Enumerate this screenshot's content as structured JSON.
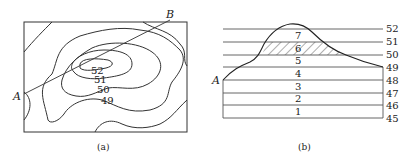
{
  "figure_a": {
    "caption": "(a)",
    "point_a": "A",
    "point_b": "B",
    "contour_labels": [
      "52",
      "51",
      "50",
      "49"
    ]
  },
  "figure_b": {
    "caption": "(b)",
    "point_a": "A",
    "elevation_labels": [
      "52",
      "51",
      "50",
      "49",
      "48",
      "47",
      "46",
      "45"
    ],
    "band_labels": [
      "7",
      "6",
      "5",
      "4",
      "3",
      "2",
      "1"
    ],
    "hatched_band": "6"
  }
}
